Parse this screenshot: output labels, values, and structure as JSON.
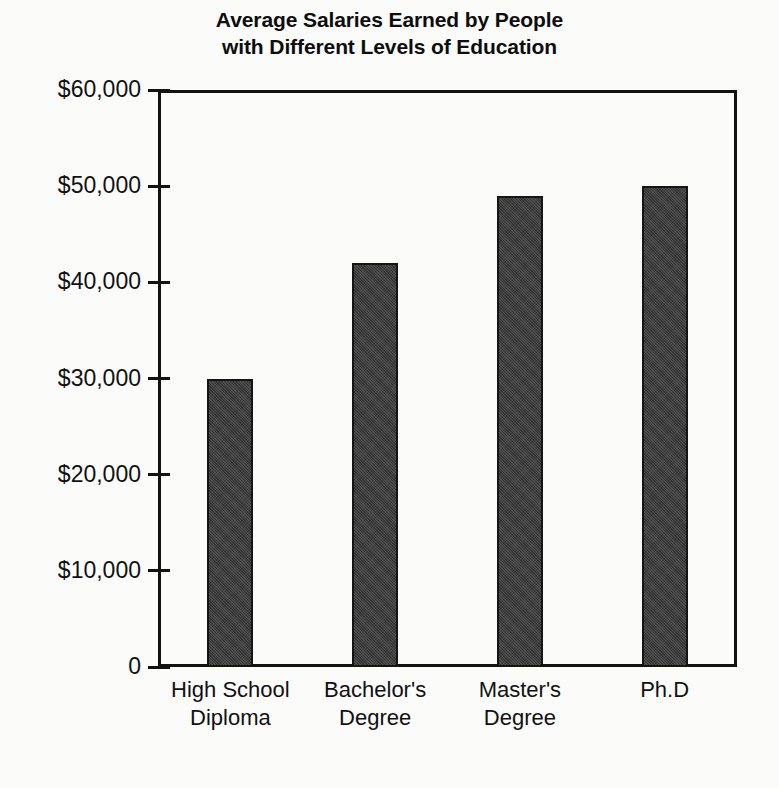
{
  "title": {
    "line1": "Average Salaries Earned by People",
    "line2": "with Different Levels of Education"
  },
  "axis": {
    "y_ticks": [
      "$60,000",
      "$50,000",
      "$40,000",
      "$30,000",
      "$20,000",
      "$10,000",
      "0"
    ]
  },
  "bars": [
    {
      "label_line1": "High School",
      "label_line2": "Diploma",
      "value": 30000
    },
    {
      "label_line1": "Bachelor's",
      "label_line2": "Degree",
      "value": 42000
    },
    {
      "label_line1": "Master's",
      "label_line2": "Degree",
      "value": 49000
    },
    {
      "label_line1": "Ph.D",
      "label_line2": "",
      "value": 50000
    }
  ],
  "colors": {
    "bar_fill": "#3c3c3c",
    "bar_outline": "#151515",
    "axis": "#121212",
    "text": "#111111",
    "background": "#fbfbfa"
  },
  "chart_data": {
    "type": "bar",
    "title": "Average Salaries Earned by People with Different Levels of Education",
    "categories": [
      "High School Diploma",
      "Bachelor's Degree",
      "Master's Degree",
      "Ph.D"
    ],
    "values": [
      30000,
      42000,
      49000,
      50000
    ],
    "xlabel": "",
    "ylabel": "",
    "ylim": [
      0,
      60000
    ],
    "ytick_values": [
      0,
      10000,
      20000,
      30000,
      40000,
      50000,
      60000
    ],
    "ytick_labels": [
      "0",
      "$10,000",
      "$20,000",
      "$30,000",
      "$40,000",
      "$50,000",
      "$60,000"
    ],
    "grid": false,
    "legend": false
  }
}
